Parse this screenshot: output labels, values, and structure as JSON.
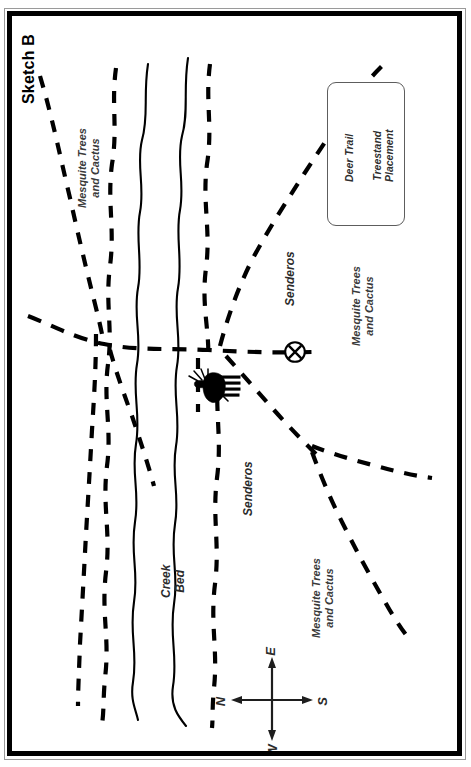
{
  "document": {
    "title": "Sketch B"
  },
  "map": {
    "labels": {
      "mesquite": "Mesquite Trees\nand Cactus",
      "mesquite_line1": "Mesquite Trees",
      "mesquite_line2": "and Cactus",
      "senderos": "Senderos",
      "creek_bed_line1": "Creek",
      "creek_bed_line2": "Bed"
    },
    "features": [
      {
        "name": "mesquite-trees-and-cactus-northwest",
        "label": "Mesquite Trees and Cactus"
      },
      {
        "name": "mesquite-trees-and-cactus-east",
        "label": "Mesquite Trees and Cactus"
      },
      {
        "name": "mesquite-trees-and-cactus-southeast",
        "label": "Mesquite Trees and Cactus"
      },
      {
        "name": "senderos-upper",
        "label": "Senderos"
      },
      {
        "name": "senderos-lower",
        "label": "Senderos"
      },
      {
        "name": "creek-bed",
        "label": "Creek Bed"
      }
    ],
    "treestand_marker": "⊗",
    "deer_icon": "deer-silhouette"
  },
  "legend": {
    "items": [
      {
        "name": "deer-trail",
        "label": "Deer Trail",
        "symbol": "dashed-line"
      },
      {
        "name": "treestand-placement",
        "label": "Treestand\nPlacement",
        "label_line1": "Treestand",
        "label_line2": "Placement",
        "symbol": "circled-x"
      }
    ]
  },
  "compass": {
    "north": "N",
    "south": "S",
    "east": "E",
    "west": "W"
  },
  "colors": {
    "ink": "#000000",
    "label_grey": "#3a3a3a",
    "frame": "#000000",
    "paper": "#ffffff"
  }
}
